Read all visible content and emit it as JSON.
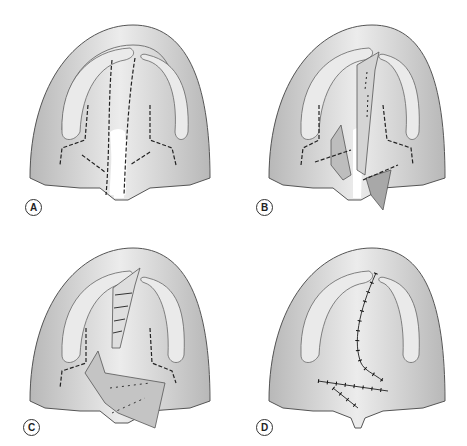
{
  "panels": [
    {
      "id": "A",
      "label": "A",
      "stage": "incision-lines-marked"
    },
    {
      "id": "B",
      "label": "B",
      "stage": "flaps-elevated"
    },
    {
      "id": "C",
      "label": "C",
      "stage": "flaps-transposed"
    },
    {
      "id": "D",
      "label": "D",
      "stage": "closure-sutured"
    }
  ],
  "colors": {
    "background": "#ffffff",
    "tissue_light": "#e6e6e6",
    "tissue_mid": "#c8c8c8",
    "tissue_dark": "#9a9a9a",
    "outline": "#555555",
    "dashed_line": "#222222"
  }
}
